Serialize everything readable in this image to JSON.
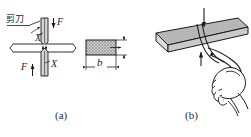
{
  "figure": {
    "title_implicit": "",
    "panels": [
      {
        "id": "a",
        "caption": "(a)",
        "labels": {
          "tool_name": "剪刀",
          "force_top": "F",
          "force_bottom": "F",
          "section_top": "X",
          "section_bottom": "X",
          "width_dim": "b"
        },
        "icons": {
          "upper_blade": "shear-blade-icon",
          "lower_blade": "shear-blade-icon",
          "plate": "flat-bar-icon",
          "cross_section": "hatched-section-icon",
          "leader": "leader-line-icon",
          "arrow_down": "arrow-down-icon",
          "arrow_up": "arrow-up-icon",
          "thickness_dim": "dimension-arrow-icon",
          "width_dim_line": "dimension-arrow-icon"
        }
      },
      {
        "id": "b",
        "caption": "(b)",
        "icons": {
          "plate_3d": "plate-3d-icon",
          "scissors": "scissors-icon",
          "hand": "hand-grip-icon",
          "arrow_down": "arrow-down-icon",
          "arrow_up": "arrow-up-icon"
        }
      }
    ]
  },
  "colors": {
    "line": "#1a1a1a",
    "hatch_fill": "#b9b9b9",
    "blade_fill": "#d4d4d4",
    "plate_fill": "#ffffff",
    "plate3d_top": "#b5b5b5",
    "plate3d_side": "#dcdcdc",
    "background": "#ffffff"
  }
}
